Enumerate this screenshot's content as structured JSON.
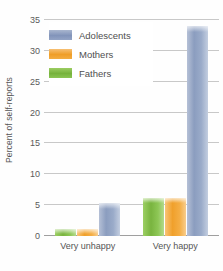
{
  "chart_data": {
    "type": "bar",
    "title": "",
    "subtitle": "",
    "xlabel": "",
    "ylabel": "Percent of self-reports",
    "categories": [
      "Very unhappy",
      "Very happy"
    ],
    "series": [
      {
        "name": "Fathers",
        "color": "#7ab63f",
        "values": [
          1.2,
          6.2
        ]
      },
      {
        "name": "Mothers",
        "color": "#f0a12c",
        "values": [
          1.2,
          6.2
        ]
      },
      {
        "name": "Adolescents",
        "color": "#8b9dbf",
        "values": [
          5.3,
          34.0
        ]
      }
    ],
    "ylim": [
      0,
      35
    ],
    "yticks": [
      0,
      5,
      10,
      15,
      20,
      25,
      30,
      35
    ],
    "ytick_labels": [
      "0",
      "5",
      "10",
      "15",
      "20",
      "25",
      "30",
      "35"
    ],
    "grid": true,
    "grid_axis": "y",
    "grid_color": "#c8c8c8",
    "legend_position": "upper-left",
    "legend_entries": [
      "Adolescents",
      "Mothers",
      "Fathers"
    ],
    "background_color": "#ffffff",
    "annotations": []
  },
  "legend": {
    "items": [
      {
        "label": "Adolescents",
        "swatch_class": "sw-adolescents"
      },
      {
        "label": "Mothers",
        "swatch_class": "sw-mothers"
      },
      {
        "label": "Fathers",
        "swatch_class": "sw-fathers"
      }
    ]
  }
}
